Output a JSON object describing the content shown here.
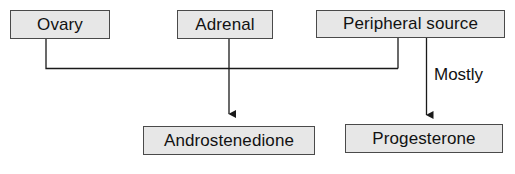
{
  "diagram": {
    "type": "flowchart",
    "colors": {
      "node_fill": "#e7e7e7",
      "node_border": "#4a4a4a",
      "text": "#121212",
      "connector": "#1a1a1a",
      "background": "#ffffff"
    },
    "nodes": [
      {
        "id": "ovary",
        "label": "Ovary",
        "role": "source"
      },
      {
        "id": "adrenal",
        "label": "Adrenal",
        "role": "source"
      },
      {
        "id": "peripheral",
        "label": "Peripheral source",
        "role": "source"
      },
      {
        "id": "androstenedione",
        "label": "Androstenedione",
        "role": "product"
      },
      {
        "id": "progesterone",
        "label": "Progesterone",
        "role": "product"
      }
    ],
    "edges": [
      {
        "from": "ovary",
        "to": "androstenedione",
        "label": "",
        "arrow": true,
        "style": "elbow"
      },
      {
        "from": "adrenal",
        "to": "androstenedione",
        "label": "",
        "arrow": true,
        "style": "straight"
      },
      {
        "from": "peripheral",
        "to": "androstenedione",
        "label": "",
        "arrow": true,
        "style": "elbow"
      },
      {
        "from": "peripheral",
        "to": "progesterone",
        "label": "Mostly",
        "arrow": true,
        "style": "straight"
      }
    ],
    "edge_labels": {
      "mostly": "Mostly"
    }
  }
}
